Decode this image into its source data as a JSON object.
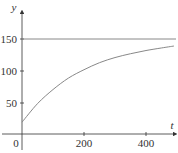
{
  "chart_data": {
    "type": "line",
    "title": "",
    "xlabel": "t",
    "ylabel": "y",
    "xlim": [
      0,
      500
    ],
    "ylim": [
      0,
      170
    ],
    "grid": false,
    "x_ticks": [
      0,
      200,
      400
    ],
    "y_ticks": [
      50,
      100,
      150
    ],
    "x_tick_labels": [
      "0",
      "200",
      "400"
    ],
    "y_tick_labels": [
      "50",
      "100",
      "150"
    ],
    "series": [
      {
        "name": "asymptote",
        "style": "horizontal-line",
        "x": [
          0,
          500
        ],
        "values": [
          150,
          150
        ]
      },
      {
        "name": "curve",
        "style": "curve",
        "x": [
          0,
          50,
          100,
          150,
          200,
          250,
          300,
          350,
          400,
          450,
          490
        ],
        "values": [
          20,
          49,
          71,
          89,
          102,
          113,
          121,
          127,
          132,
          136,
          139
        ]
      }
    ],
    "colors": {
      "axes": "#333333",
      "lines": "#888888"
    }
  }
}
